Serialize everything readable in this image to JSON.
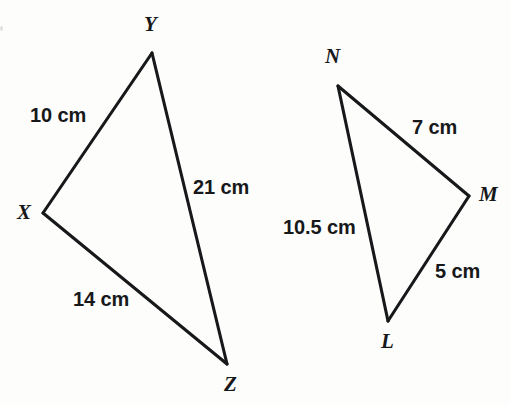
{
  "figure": {
    "background_color": "#fdfdfc",
    "stroke_color": "#17181a",
    "triangles": [
      {
        "name": "triangle-xyz",
        "vertices": [
          {
            "id": "X",
            "label": "X",
            "x": 43,
            "y": 213,
            "label_x": 17,
            "label_y": 202
          },
          {
            "id": "Y",
            "label": "Y",
            "x": 152,
            "y": 53,
            "label_x": 144,
            "label_y": 14
          },
          {
            "id": "Z",
            "label": "Z",
            "x": 227,
            "y": 364,
            "label_x": 224,
            "label_y": 374
          }
        ],
        "edges": [
          {
            "id": "XY",
            "from": "X",
            "to": "Y",
            "measure": "10 cm",
            "label_x": 30,
            "label_y": 105
          },
          {
            "id": "YZ",
            "from": "Y",
            "to": "Z",
            "measure": "21 cm",
            "label_x": 193,
            "label_y": 177
          },
          {
            "id": "XZ",
            "from": "X",
            "to": "Z",
            "measure": "14 cm",
            "label_x": 73,
            "label_y": 289
          }
        ]
      },
      {
        "name": "triangle-lmn",
        "vertices": [
          {
            "id": "N",
            "label": "N",
            "x": 338,
            "y": 86,
            "label_x": 325,
            "label_y": 46
          },
          {
            "id": "M",
            "label": "M",
            "x": 469,
            "y": 196,
            "label_x": 479,
            "label_y": 184
          },
          {
            "id": "L",
            "label": "L",
            "x": 388,
            "y": 321,
            "label_x": 381,
            "label_y": 331
          }
        ],
        "edges": [
          {
            "id": "NM",
            "from": "N",
            "to": "M",
            "measure": "7 cm",
            "label_x": 412,
            "label_y": 117
          },
          {
            "id": "ML",
            "from": "M",
            "to": "L",
            "measure": "5 cm",
            "label_x": 435,
            "label_y": 261
          },
          {
            "id": "NL",
            "from": "N",
            "to": "L",
            "measure": "10.5 cm",
            "label_x": 283,
            "label_y": 217
          }
        ]
      }
    ]
  }
}
